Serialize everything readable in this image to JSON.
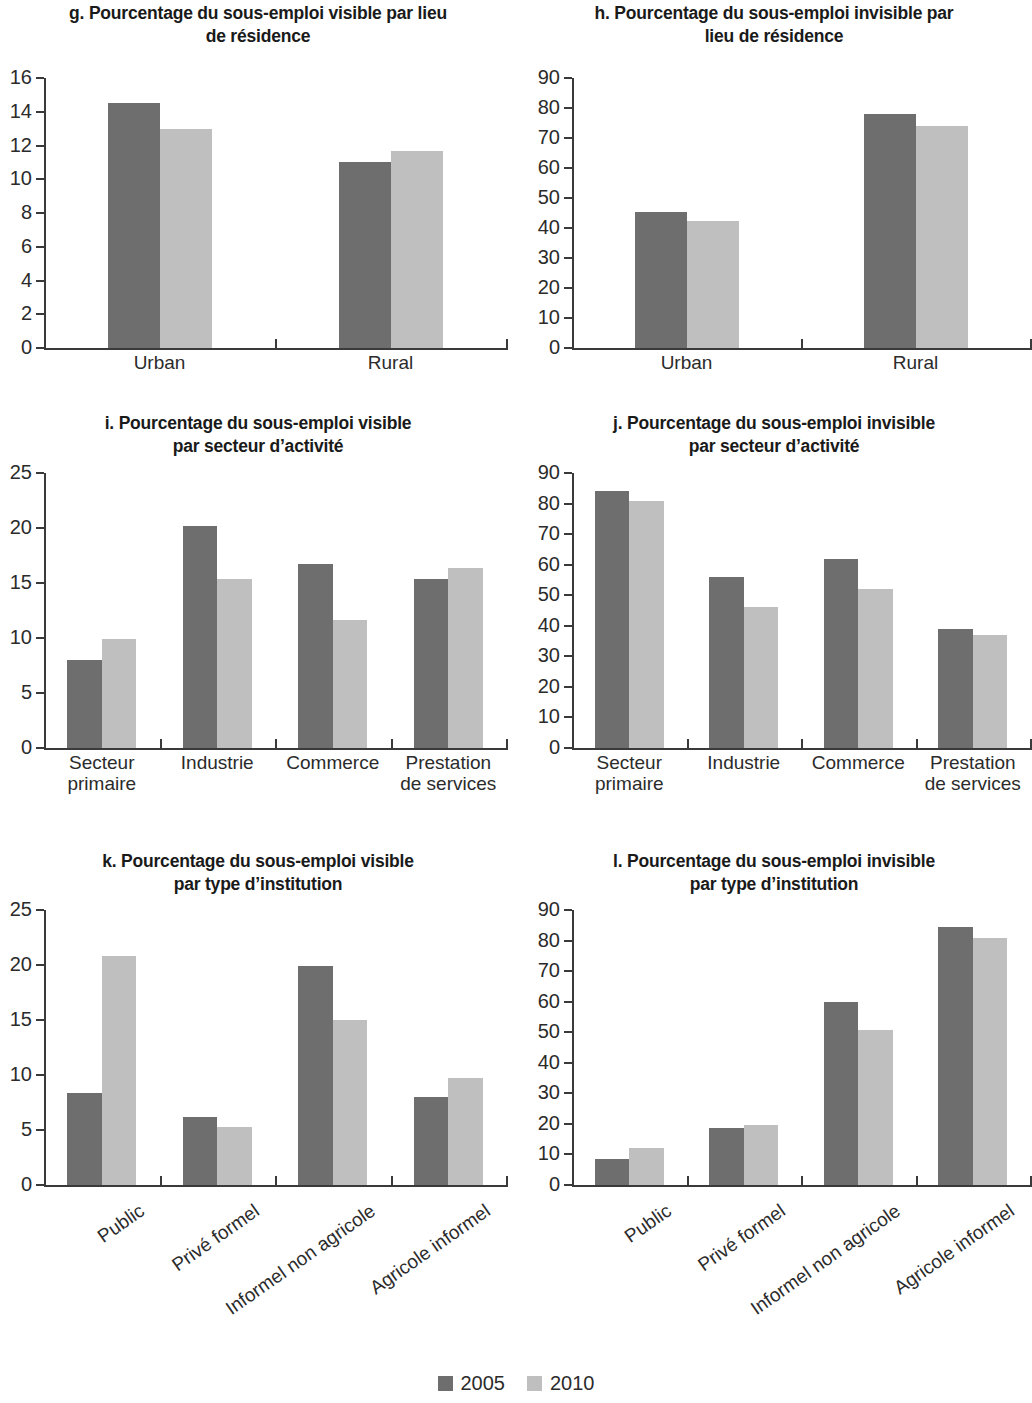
{
  "legend": {
    "entries": [
      {
        "label": "2005",
        "color": "#6e6e6e"
      },
      {
        "label": "2010",
        "color": "#bfbfbf"
      }
    ]
  },
  "charts": [
    {
      "title_line1": "g. Pourcentage du sous-emploi visible par lieu",
      "title_line2": "de résidence"
    },
    {
      "title_line1": "h. Pourcentage du sous-emploi invisible par",
      "title_line2": "lieu de résidence"
    },
    {
      "title_line1": "i. Pourcentage du sous-emploi visible",
      "title_line2": "par secteur d’activité"
    },
    {
      "title_line1": "j. Pourcentage du sous-emploi invisible",
      "title_line2": "par secteur d’activité"
    },
    {
      "title_line1": "k. Pourcentage du sous-emploi visible",
      "title_line2": "par type d’institution"
    },
    {
      "title_line1": "l. Pourcentage du sous-emploi invisible",
      "title_line2": "par type d’institution"
    }
  ],
  "chart_data": [
    {
      "id": "g",
      "type": "bar",
      "title": "g. Pourcentage du sous-emploi visible par lieu de résidence",
      "xlabel": "",
      "ylabel": "",
      "ylim": [
        0,
        16
      ],
      "yticks": [
        0,
        2,
        4,
        6,
        8,
        10,
        12,
        14,
        16
      ],
      "grid": false,
      "legend_position": "bottom-shared",
      "categories": [
        "Urban",
        "Rural"
      ],
      "series": [
        {
          "name": "2005",
          "color": "#6e6e6e",
          "values": [
            14.5,
            11.0
          ]
        },
        {
          "name": "2010",
          "color": "#bfbfbf",
          "values": [
            13.0,
            11.7
          ]
        }
      ]
    },
    {
      "id": "h",
      "type": "bar",
      "title": "h. Pourcentage du sous-emploi invisible par lieu de résidence",
      "xlabel": "",
      "ylabel": "",
      "ylim": [
        0,
        90
      ],
      "yticks": [
        0,
        10,
        20,
        30,
        40,
        50,
        60,
        70,
        80,
        90
      ],
      "grid": false,
      "legend_position": "bottom-shared",
      "categories": [
        "Urban",
        "Rural"
      ],
      "series": [
        {
          "name": "2005",
          "color": "#6e6e6e",
          "values": [
            45.5,
            78.0
          ]
        },
        {
          "name": "2010",
          "color": "#bfbfbf",
          "values": [
            42.5,
            74.0
          ]
        }
      ]
    },
    {
      "id": "i",
      "type": "bar",
      "title": "i. Pourcentage du sous-emploi visible par secteur d’activité",
      "xlabel": "",
      "ylabel": "",
      "ylim": [
        0,
        25
      ],
      "yticks": [
        0,
        5,
        10,
        15,
        20,
        25
      ],
      "grid": false,
      "legend_position": "bottom-shared",
      "categories": [
        "Secteur primaire",
        "Industrie",
        "Commerce",
        "Prestation de services"
      ],
      "category_lines": [
        [
          "Secteur",
          "primaire"
        ],
        [
          "Industrie"
        ],
        [
          "Commerce"
        ],
        [
          "Prestation",
          "de services"
        ]
      ],
      "series": [
        {
          "name": "2005",
          "color": "#6e6e6e",
          "values": [
            8.0,
            20.2,
            16.7,
            15.4
          ]
        },
        {
          "name": "2010",
          "color": "#bfbfbf",
          "values": [
            9.9,
            15.4,
            11.6,
            16.4
          ]
        }
      ]
    },
    {
      "id": "j",
      "type": "bar",
      "title": "j. Pourcentage du sous-emploi invisible par secteur d’activité",
      "xlabel": "",
      "ylabel": "",
      "ylim": [
        0,
        90
      ],
      "yticks": [
        0,
        10,
        20,
        30,
        40,
        50,
        60,
        70,
        80,
        90
      ],
      "grid": false,
      "legend_position": "bottom-shared",
      "categories": [
        "Secteur primaire",
        "Industrie",
        "Commerce",
        "Prestation de services"
      ],
      "category_lines": [
        [
          "Secteur",
          "primaire"
        ],
        [
          "Industrie"
        ],
        [
          "Commerce"
        ],
        [
          "Prestation",
          "de services"
        ]
      ],
      "series": [
        {
          "name": "2005",
          "color": "#6e6e6e",
          "values": [
            84.0,
            56.0,
            62.0,
            39.0
          ]
        },
        {
          "name": "2010",
          "color": "#bfbfbf",
          "values": [
            81.0,
            46.0,
            52.0,
            37.0
          ]
        }
      ]
    },
    {
      "id": "k",
      "type": "bar",
      "title": "k. Pourcentage du sous-emploi visible par type d’institution",
      "xlabel": "",
      "ylabel": "",
      "ylim": [
        0,
        25
      ],
      "yticks": [
        0,
        5,
        10,
        15,
        20,
        25
      ],
      "grid": false,
      "legend_position": "bottom-shared",
      "categories": [
        "Public",
        "Privé formel",
        "Informel non agricole",
        "Agricole informel"
      ],
      "series": [
        {
          "name": "2005",
          "color": "#6e6e6e",
          "values": [
            8.4,
            6.2,
            19.9,
            8.0
          ]
        },
        {
          "name": "2010",
          "color": "#bfbfbf",
          "values": [
            20.8,
            5.3,
            15.0,
            9.7
          ]
        }
      ]
    },
    {
      "id": "l",
      "type": "bar",
      "title": "l. Pourcentage du sous-emploi invisible par type d’institution",
      "xlabel": "",
      "ylabel": "",
      "ylim": [
        0,
        90
      ],
      "yticks": [
        0,
        10,
        20,
        30,
        40,
        50,
        60,
        70,
        80,
        90
      ],
      "grid": false,
      "legend_position": "bottom-shared",
      "categories": [
        "Public",
        "Privé formel",
        "Informel non agricole",
        "Agricole informel"
      ],
      "series": [
        {
          "name": "2005",
          "color": "#6e6e6e",
          "values": [
            8.6,
            18.7,
            59.8,
            84.3
          ]
        },
        {
          "name": "2010",
          "color": "#bfbfbf",
          "values": [
            12.0,
            19.7,
            50.6,
            81.0
          ]
        }
      ]
    }
  ]
}
